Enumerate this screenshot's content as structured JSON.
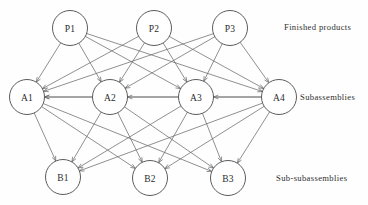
{
  "diagram": {
    "width": 368,
    "height": 205,
    "node_radius": 17.5,
    "colors": {
      "background": "#fefefe",
      "node_fill": "#ffffff",
      "node_stroke": "#4a4a4a",
      "edge_stroke": "#6b6b6b",
      "text": "#2b2b2b"
    },
    "tiers": [
      {
        "id": "tier-finished-products",
        "label": "Finished products",
        "y": 28
      },
      {
        "id": "tier-subassemblies",
        "label": "Subassemblies",
        "y": 97
      },
      {
        "id": "tier-sub-subassemblies",
        "label": "Sub-subassemblies",
        "y": 177
      }
    ],
    "nodes": [
      {
        "id": "P1",
        "label": "P1",
        "x": 70,
        "y": 28,
        "tier": 0
      },
      {
        "id": "P2",
        "label": "P2",
        "x": 154,
        "y": 28,
        "tier": 0
      },
      {
        "id": "P3",
        "label": "P3",
        "x": 230,
        "y": 28,
        "tier": 0
      },
      {
        "id": "A1",
        "label": "A1",
        "x": 27,
        "y": 97,
        "tier": 1
      },
      {
        "id": "A2",
        "label": "A2",
        "x": 110,
        "y": 97,
        "tier": 1
      },
      {
        "id": "A3",
        "label": "A3",
        "x": 196,
        "y": 97,
        "tier": 1
      },
      {
        "id": "A4",
        "label": "A4",
        "x": 279,
        "y": 97,
        "tier": 1
      },
      {
        "id": "B1",
        "label": "B1",
        "x": 63,
        "y": 177,
        "tier": 2
      },
      {
        "id": "B2",
        "label": "B2",
        "x": 150,
        "y": 178,
        "tier": 2
      },
      {
        "id": "B3",
        "label": "B3",
        "x": 228,
        "y": 178,
        "tier": 2
      }
    ],
    "edges": [
      {
        "from": "P1",
        "to": "A1"
      },
      {
        "from": "P1",
        "to": "A2"
      },
      {
        "from": "P1",
        "to": "A3"
      },
      {
        "from": "P1",
        "to": "A4"
      },
      {
        "from": "P2",
        "to": "A1"
      },
      {
        "from": "P2",
        "to": "A2"
      },
      {
        "from": "P2",
        "to": "A3"
      },
      {
        "from": "P2",
        "to": "A4"
      },
      {
        "from": "P3",
        "to": "A1"
      },
      {
        "from": "P3",
        "to": "A2"
      },
      {
        "from": "P3",
        "to": "A3"
      },
      {
        "from": "P3",
        "to": "A4"
      },
      {
        "from": "A2",
        "to": "A1"
      },
      {
        "from": "A3",
        "to": "A2"
      },
      {
        "from": "A4",
        "to": "A3"
      },
      {
        "from": "A4",
        "to": "A1"
      },
      {
        "from": "A1",
        "to": "B1"
      },
      {
        "from": "A1",
        "to": "B2"
      },
      {
        "from": "A1",
        "to": "B3"
      },
      {
        "from": "A2",
        "to": "B1"
      },
      {
        "from": "A2",
        "to": "B2"
      },
      {
        "from": "A2",
        "to": "B3"
      },
      {
        "from": "A3",
        "to": "B1"
      },
      {
        "from": "A3",
        "to": "B2"
      },
      {
        "from": "A3",
        "to": "B3"
      },
      {
        "from": "A4",
        "to": "B1"
      },
      {
        "from": "A4",
        "to": "B2"
      },
      {
        "from": "A4",
        "to": "B3"
      }
    ]
  }
}
